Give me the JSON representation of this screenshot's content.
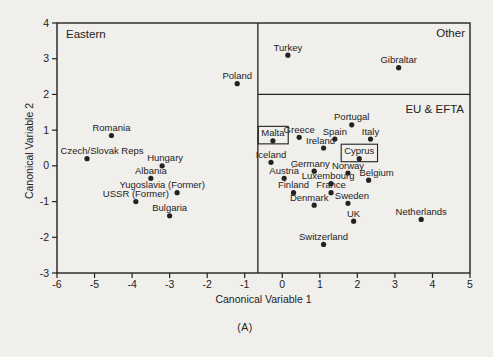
{
  "figure": {
    "caption": "(A)",
    "background": "#f1efec",
    "ink": "#222222"
  },
  "chart_data": {
    "type": "scatter",
    "title": "",
    "xlabel": "Canonical Variable 1",
    "ylabel": "Canonical Variable 2",
    "xlim": [
      -6,
      5
    ],
    "ylim": [
      -3,
      4
    ],
    "x_ticks": [
      -6,
      -5,
      -4,
      -3,
      -2,
      -1,
      0,
      1,
      2,
      3,
      4,
      5
    ],
    "y_ticks": [
      -3,
      -2,
      -1,
      0,
      1,
      2,
      3,
      4
    ],
    "grid": false,
    "legend": "none",
    "marker_color": "#111111",
    "dividers": {
      "vertical_x": -0.65,
      "horizontal_y": 2.0
    },
    "regions": [
      {
        "label": "Eastern",
        "position": "top-left"
      },
      {
        "label": "Other",
        "position": "top-right"
      },
      {
        "label": "EU & EFTA",
        "position": "right-mid"
      }
    ],
    "points": [
      {
        "label": "Poland",
        "x": -1.2,
        "y": 2.3,
        "group": "Eastern"
      },
      {
        "label": "Romania",
        "x": -4.55,
        "y": 0.85,
        "group": "Eastern"
      },
      {
        "label": "Czech/Slovak Reps",
        "x": -5.2,
        "y": 0.2,
        "group": "Eastern",
        "label_dx": 15
      },
      {
        "label": "Hungary",
        "x": -3.2,
        "y": 0.0,
        "group": "Eastern",
        "label_dx": 3
      },
      {
        "label": "Albania",
        "x": -3.5,
        "y": -0.35,
        "group": "Eastern"
      },
      {
        "label": "Yugoslavia (Former)",
        "x": -2.8,
        "y": -0.75,
        "group": "Eastern",
        "label_dx": -15
      },
      {
        "label": "USSR (Former)",
        "x": -3.9,
        "y": -1.0,
        "group": "Eastern"
      },
      {
        "label": "Bulgaria",
        "x": -3.0,
        "y": -1.4,
        "group": "Eastern"
      },
      {
        "label": "Turkey",
        "x": 0.15,
        "y": 3.1,
        "group": "Other"
      },
      {
        "label": "Gibraltar",
        "x": 3.1,
        "y": 2.75,
        "group": "Other"
      },
      {
        "label": "Portugal",
        "x": 1.85,
        "y": 1.15,
        "group": "EU & EFTA"
      },
      {
        "label": "Greece",
        "x": 0.45,
        "y": 0.8,
        "group": "EU & EFTA"
      },
      {
        "label": "Spain",
        "x": 1.4,
        "y": 0.75,
        "group": "EU & EFTA"
      },
      {
        "label": "Italy",
        "x": 2.35,
        "y": 0.75,
        "group": "EU & EFTA"
      },
      {
        "label": "Malta",
        "x": -0.25,
        "y": 0.7,
        "group": "EU & EFTA",
        "boxed": true
      },
      {
        "label": "Ireland",
        "x": 1.1,
        "y": 0.5,
        "group": "EU & EFTA",
        "label_dx": -3
      },
      {
        "label": "Cyprus",
        "x": 2.05,
        "y": 0.2,
        "group": "EU & EFTA",
        "boxed": true
      },
      {
        "label": "Iceland",
        "x": -0.3,
        "y": 0.1,
        "group": "EU & EFTA"
      },
      {
        "label": "Germany",
        "x": 0.85,
        "y": -0.15,
        "group": "EU & EFTA",
        "label_dx": -4
      },
      {
        "label": "Norway",
        "x": 1.75,
        "y": -0.2,
        "group": "EU & EFTA"
      },
      {
        "label": "Austria",
        "x": 0.05,
        "y": -0.35,
        "group": "EU & EFTA"
      },
      {
        "label": "Belgium",
        "x": 2.3,
        "y": -0.4,
        "group": "EU & EFTA",
        "label_dx": 8
      },
      {
        "label": "Luxembourg",
        "x": 1.3,
        "y": -0.5,
        "group": "EU & EFTA",
        "label_dx": -3
      },
      {
        "label": "Finland",
        "x": 0.3,
        "y": -0.75,
        "group": "EU & EFTA"
      },
      {
        "label": "France",
        "x": 1.3,
        "y": -0.75,
        "group": "EU & EFTA"
      },
      {
        "label": "Denmark",
        "x": 0.85,
        "y": -1.1,
        "group": "EU & EFTA",
        "label_dx": -5
      },
      {
        "label": "Sweden",
        "x": 1.75,
        "y": -1.05,
        "group": "EU & EFTA",
        "label_dx": 4
      },
      {
        "label": "UK",
        "x": 1.9,
        "y": -1.55,
        "group": "EU & EFTA"
      },
      {
        "label": "Netherlands",
        "x": 3.7,
        "y": -1.5,
        "group": "EU & EFTA"
      },
      {
        "label": "Switzerland",
        "x": 1.1,
        "y": -2.2,
        "group": "EU & EFTA"
      }
    ]
  }
}
